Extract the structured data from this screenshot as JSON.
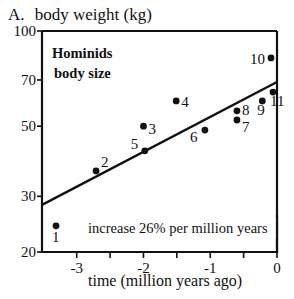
{
  "chart_data": {
    "type": "scatter",
    "panel_label": "A.",
    "title": "body weight (kg)",
    "xlabel": "time (million years ago)",
    "ylabel": "body weight (kg)",
    "yscale": "log",
    "xlim": [
      -3.52,
      0
    ],
    "ylim": [
      20,
      100
    ],
    "grid": false,
    "x_ticks": [
      -3,
      -2,
      -1,
      0
    ],
    "x_tick_labels": [
      "-3",
      "-2",
      "-1",
      "0"
    ],
    "x_minor_ticks": [
      -2.5,
      -1.5,
      -0.5
    ],
    "y_ticks": [
      20,
      30,
      50,
      70,
      100
    ],
    "y_tick_labels": [
      "20",
      "30",
      "50",
      "70",
      "100"
    ],
    "annotations": {
      "box_title_line1": "Hominids",
      "box_title_line2": "body size",
      "trend_text": "increase 26% per million years"
    },
    "series": [
      {
        "name": "Hominid species",
        "points": [
          {
            "label": "1",
            "x": -3.31,
            "y": 24.2
          },
          {
            "label": "2",
            "x": -2.71,
            "y": 36.1
          },
          {
            "label": "3",
            "x": -2.0,
            "y": 50.0
          },
          {
            "label": "4",
            "x": -1.51,
            "y": 60.1
          },
          {
            "label": "5",
            "x": -1.98,
            "y": 41.8
          },
          {
            "label": "6",
            "x": -1.08,
            "y": 48.6
          },
          {
            "label": "7",
            "x": -0.6,
            "y": 52.3
          },
          {
            "label": "8",
            "x": -0.6,
            "y": 55.9
          },
          {
            "label": "9",
            "x": -0.22,
            "y": 60.1
          },
          {
            "label": "10",
            "x": -0.09,
            "y": 82.2
          },
          {
            "label": "11",
            "x": -0.06,
            "y": 64.1
          }
        ]
      }
    ],
    "trend_line": {
      "x": [
        -3.52,
        0
      ],
      "y": [
        28.2,
        69.0
      ]
    }
  }
}
